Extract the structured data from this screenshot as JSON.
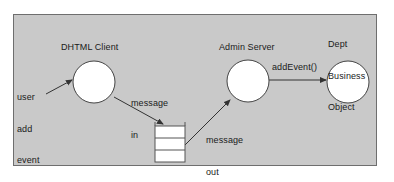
{
  "diagram": {
    "frame": {
      "background_color": "#c9c9c9",
      "border_color": "#6e6e6e"
    },
    "nodes": [
      {
        "id": "dhtml-client",
        "shape": "circle",
        "label": "DHTML Client",
        "label_position": "above"
      },
      {
        "id": "admin-server",
        "shape": "circle",
        "label": "Admin Server",
        "label_position": "above"
      },
      {
        "id": "dept-business-object",
        "shape": "circle",
        "label": "Dept\nBusiness\nObject",
        "label_line_1": "Dept",
        "label_line_2": "Business",
        "label_line_3": "Object",
        "label_position": "above"
      },
      {
        "id": "message-queue",
        "shape": "stacked-box",
        "cells": 3,
        "label": ""
      }
    ],
    "edges": [
      {
        "id": "user-add-event",
        "label_line_1": "user",
        "label_line_2": "add",
        "label_line_3": "event",
        "from": "user",
        "to": "dhtml-client"
      },
      {
        "id": "message-in",
        "label_line_1": "message",
        "label_line_2": "in",
        "from": "dhtml-client",
        "to": "message-queue"
      },
      {
        "id": "message-out",
        "label_line_1": "message",
        "label_line_2": "out",
        "from": "message-queue",
        "to": "admin-server"
      },
      {
        "id": "add-event-call",
        "label": "addEvent()",
        "from": "admin-server",
        "to": "dept-business-object"
      }
    ],
    "colors": {
      "node_fill": "#ffffff",
      "node_stroke": "#444444",
      "arrow": "#333333",
      "text": "#1a1a1a"
    }
  }
}
